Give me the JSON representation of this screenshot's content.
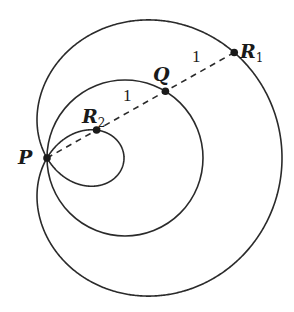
{
  "diagram": {
    "type": "limacon",
    "pole": {
      "x": 47,
      "y": 158
    },
    "circle_diameter_px": 156,
    "unit_length_px": 79,
    "ray_angle_deg": 29.4,
    "stroke_color": "#2a2a2a",
    "points": {
      "P": {
        "label": "P",
        "subscript": ""
      },
      "R2": {
        "label": "R",
        "subscript": "2"
      },
      "Q": {
        "label": "Q",
        "subscript": ""
      },
      "R1": {
        "label": "R",
        "subscript": "1"
      }
    },
    "segment_labels": {
      "R2_Q": "1",
      "Q_R1": "1"
    }
  }
}
